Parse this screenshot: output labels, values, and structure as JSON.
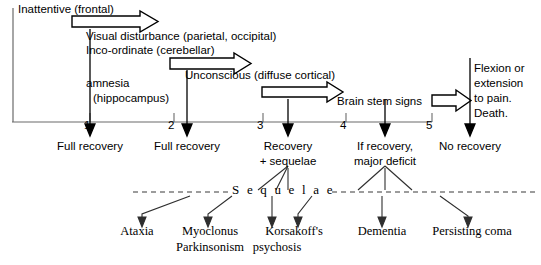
{
  "diagram": {
    "title_hidden": "Coma grading / outcome timeline",
    "axis": {
      "label_hidden": "coma grade",
      "ticks": [
        "1",
        "2",
        "3",
        "4",
        "5"
      ],
      "x_start": 12,
      "x_end": 432,
      "y": 122,
      "tick_x": [
        90,
        174,
        263,
        346,
        432
      ]
    },
    "stage_labels": [
      {
        "id": "inattentive",
        "text": "Inattentive (frontal)",
        "x": 18,
        "y": 4
      },
      {
        "id": "visual-disturbance",
        "text": "Visual disturbance (parietal, occipital)",
        "x": 86,
        "y": 31
      },
      {
        "id": "inco-ordinate",
        "text": "Inco-ordinate (cerebellar)",
        "x": 86,
        "y": 45
      },
      {
        "id": "amnesia",
        "text": "amnesia",
        "x": 86,
        "y": 78
      },
      {
        "id": "hippocampus",
        "text": "(hippocampus)",
        "x": 93,
        "y": 94
      },
      {
        "id": "unconscious",
        "text": "Unconscious (diffuse cortical)",
        "x": 185,
        "y": 70
      },
      {
        "id": "brain-stem-signs",
        "text": "Brain stem signs",
        "x": 337,
        "y": 96
      }
    ],
    "terminal_label": {
      "id": "flexion-extension-death",
      "lines": [
        "Flexion or",
        "extension",
        "to pain.",
        "Death."
      ],
      "x": 474,
      "y": 63
    },
    "outcomes": [
      {
        "id": "outcome-1",
        "lines": [
          "Full recovery"
        ],
        "center_x": 90,
        "y": 140
      },
      {
        "id": "outcome-2",
        "lines": [
          "Full recovery"
        ],
        "center_x": 187,
        "y": 140
      },
      {
        "id": "outcome-3",
        "lines": [
          "Recovery",
          "+ sequelae"
        ],
        "center_x": 288,
        "y": 140
      },
      {
        "id": "outcome-4",
        "lines": [
          "If recovery,",
          "major deficit"
        ],
        "center_x": 385,
        "y": 140
      },
      {
        "id": "outcome-5",
        "lines": [
          "No recovery"
        ],
        "center_x": 470,
        "y": 140
      }
    ],
    "sequelae_divider": {
      "label": "S e q u e l a e",
      "label_x": 232,
      "label_y": 184,
      "line_y": 192,
      "left_x": 133,
      "right_x": 535,
      "gap_left": 228,
      "gap_right": 330
    },
    "sequelae_items": [
      {
        "id": "ataxia",
        "lines": [
          "Ataxia"
        ],
        "center_x": 137,
        "y": 232
      },
      {
        "id": "myoclonus-parkinsonism",
        "lines": [
          "Myoclonus",
          "Parkinsonism"
        ],
        "center_x": 210,
        "y": 232
      },
      {
        "id": "korsakoffs-psychosis",
        "lines": [
          "Korsakoff's",
          "psychosis"
        ],
        "center_x": 294,
        "y": 232
      },
      {
        "id": "dementia",
        "lines": [
          "Dementia"
        ],
        "center_x": 382,
        "y": 232
      },
      {
        "id": "persisting-coma",
        "lines": [
          "Persisting coma"
        ],
        "center_x": 472,
        "y": 232
      }
    ],
    "block_arrows": [
      {
        "id": "block-arrow-inattentive",
        "x1": 72,
        "x2": 158,
        "y": 14,
        "h": 15
      },
      {
        "id": "block-arrow-visual",
        "x1": 170,
        "x2": 251,
        "y": 56,
        "h": 15
      },
      {
        "id": "block-arrow-unconscious",
        "x1": 262,
        "x2": 343,
        "y": 85,
        "h": 14
      },
      {
        "id": "block-arrow-terminal",
        "x1": 432,
        "x2": 471,
        "y": 93,
        "h": 15
      }
    ],
    "drop_arrows_x": [
      90,
      187,
      288,
      385,
      470
    ],
    "colors": {
      "ink": "#000000",
      "axis": "#555555",
      "background": "#ffffff"
    }
  }
}
